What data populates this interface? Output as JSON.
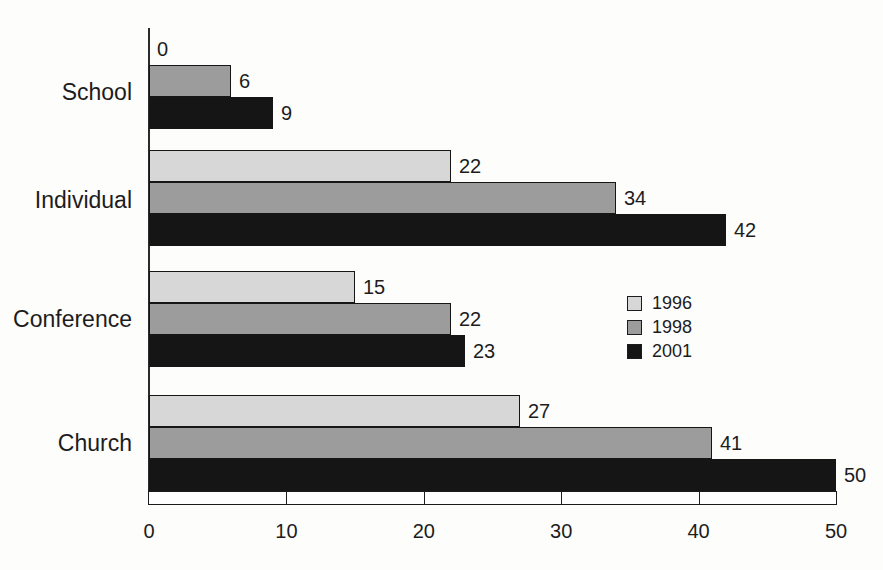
{
  "chart_data": {
    "type": "bar",
    "orientation": "horizontal",
    "title": "",
    "categories": [
      "School",
      "Individual",
      "Conference",
      "Church"
    ],
    "series": [
      {
        "name": "1996",
        "color": "#d7d7d7",
        "values": [
          0,
          22,
          15,
          27
        ]
      },
      {
        "name": "1998",
        "color": "#9c9c9c",
        "values": [
          6,
          34,
          22,
          41
        ]
      },
      {
        "name": "2001",
        "color": "#151515",
        "values": [
          9,
          42,
          23,
          50
        ]
      }
    ],
    "value_labels_shown": true,
    "xlabel": "",
    "ylabel": "",
    "xlim": [
      0,
      50
    ],
    "x_ticks": [
      "0",
      "10",
      "20",
      "30",
      "40",
      "50"
    ],
    "grid": false,
    "legend": {
      "position": "center-right",
      "entries": [
        "1996",
        "1998",
        "2001"
      ]
    }
  },
  "colors": {
    "background": "#fdfdfc",
    "axis": "#1c1c1c",
    "text": "#1c1c1c",
    "bar_1996": "#d7d7d7",
    "bar_1998": "#9c9c9c",
    "bar_2001": "#151515"
  }
}
